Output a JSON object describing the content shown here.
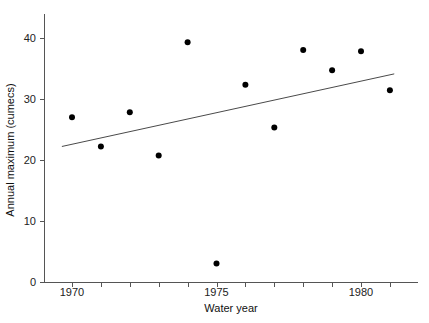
{
  "chart_data": {
    "type": "scatter",
    "title": "",
    "xlabel": "Water year",
    "ylabel": "Annual maximum (cumecs)",
    "xlim": [
      1969.0,
      1981.9
    ],
    "ylim": [
      0,
      44
    ],
    "grid": false,
    "legend": "none",
    "x_ticks": [
      1970,
      1975,
      1980
    ],
    "x_tick_labels": [
      "1970",
      "1975",
      "1980"
    ],
    "x_minor_ticks": [
      1971,
      1972,
      1973,
      1974,
      1976,
      1977,
      1978,
      1979,
      1981
    ],
    "y_ticks": [
      0,
      10,
      20,
      30,
      40
    ],
    "y_tick_labels": [
      "0",
      "10",
      "20",
      "30",
      "40"
    ],
    "x": [
      1970,
      1971,
      1972,
      1973,
      1974,
      1975,
      1976,
      1977,
      1978,
      1979,
      1980,
      1981
    ],
    "values": [
      27.1,
      22.3,
      27.9,
      20.8,
      39.4,
      3.1,
      32.4,
      25.4,
      38.1,
      34.8,
      37.9,
      31.5
    ],
    "points": [
      {
        "x": 1970,
        "y": 27.1
      },
      {
        "x": 1971,
        "y": 22.3
      },
      {
        "x": 1972,
        "y": 27.9
      },
      {
        "x": 1973,
        "y": 20.8
      },
      {
        "x": 1974,
        "y": 39.4
      },
      {
        "x": 1975,
        "y": 3.1
      },
      {
        "x": 1976,
        "y": 32.4
      },
      {
        "x": 1977,
        "y": 25.4
      },
      {
        "x": 1978,
        "y": 38.1
      },
      {
        "x": 1979,
        "y": 34.8
      },
      {
        "x": 1980,
        "y": 37.9
      },
      {
        "x": 1981,
        "y": 31.5
      }
    ],
    "trend_line": {
      "name": "linear trend",
      "x_start": 1969.65,
      "y_start": 22.3,
      "x_end": 1981.15,
      "y_end": 34.2
    },
    "marker": {
      "shape": "circle",
      "color": "#000000",
      "radius_px": 3
    },
    "colors": {
      "marker": "#000000",
      "trend": "#4a4a4a",
      "axis": "#555555",
      "text": "#111111",
      "background": "#ffffff"
    }
  }
}
